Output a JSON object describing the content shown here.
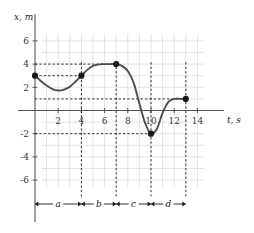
{
  "chart_data": {
    "type": "line",
    "title": "",
    "subtitle": "",
    "xlabel": "t, s",
    "ylabel": "x, m",
    "xlim": [
      -1,
      15
    ],
    "ylim": [
      -7,
      7
    ],
    "grid": true,
    "legend": null,
    "x_ticks": [
      2,
      4,
      6,
      8,
      10,
      12,
      14
    ],
    "x_tick_labels": [
      "2",
      "4",
      "6",
      "8",
      "10",
      "12",
      "14"
    ],
    "y_ticks": [
      6,
      4,
      2,
      -2,
      -4,
      -6
    ],
    "y_tick_labels": [
      "6",
      "4",
      "2",
      "-2",
      "-4",
      "-6"
    ],
    "x": [
      0,
      0.5,
      1,
      1.5,
      2,
      2.5,
      3,
      3.5,
      4,
      4.5,
      5,
      5.5,
      6,
      6.5,
      7,
      7.5,
      8,
      8.5,
      9,
      9.5,
      10,
      10.5,
      11,
      11.5,
      12,
      12.5,
      13
    ],
    "values": [
      3.0,
      2.55,
      2.15,
      1.85,
      1.72,
      1.8,
      2.05,
      2.5,
      3.0,
      3.5,
      3.85,
      3.98,
      4.0,
      4.0,
      4.0,
      3.85,
      3.4,
      2.4,
      0.6,
      -1.1,
      -2.0,
      -1.6,
      -0.2,
      0.75,
      1.0,
      1.0,
      1.0
    ],
    "markers": [
      {
        "t": 0,
        "x": 3,
        "label": ""
      },
      {
        "t": 4,
        "x": 3,
        "label": ""
      },
      {
        "t": 7,
        "x": 4,
        "label": ""
      },
      {
        "t": 10,
        "x": -2,
        "label": ""
      },
      {
        "t": 13,
        "x": 1,
        "label": ""
      }
    ],
    "guide_lines_horizontal": [
      4,
      3,
      1,
      -2
    ],
    "guide_lines_vertical": [
      4,
      7,
      10,
      13
    ],
    "intervals": [
      {
        "label": "a",
        "from": 0,
        "to": 4
      },
      {
        "label": "b",
        "from": 4,
        "to": 7
      },
      {
        "label": "c",
        "from": 7,
        "to": 10
      },
      {
        "label": "d",
        "from": 10,
        "to": 13
      }
    ],
    "colors": {
      "curve": "#4d4d4d",
      "marker": "#1a1a1a",
      "axis": "#555555",
      "grid": "#d8d8d8",
      "guide": "#1a1a1a",
      "text": "#1a1a1a",
      "background": "#ffffff"
    }
  }
}
